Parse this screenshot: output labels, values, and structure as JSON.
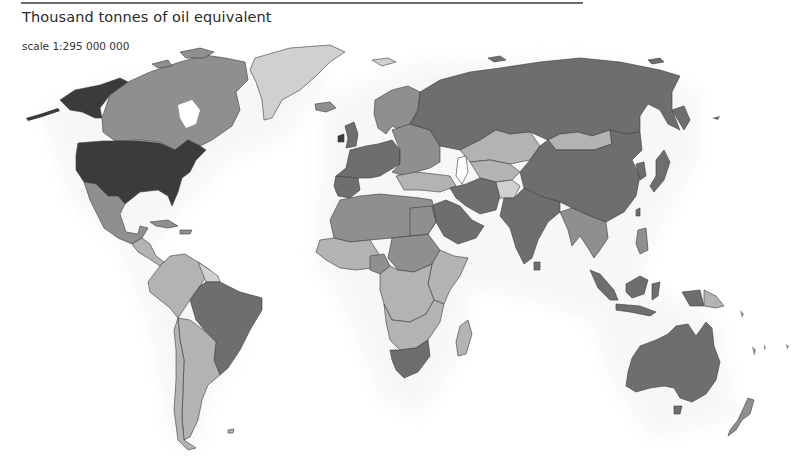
{
  "header": {
    "title": "Thousand tonnes of oil equivalent",
    "scale_label": "scale 1:295 000 000"
  },
  "map": {
    "type": "choropleth",
    "projection": "world",
    "colors": {
      "darkest": "#3b3b3b",
      "dark": "#6e6e6e",
      "medium": "#8f8f8f",
      "light": "#b3b3b3",
      "lightest": "#d0d0d0",
      "halo": "#e6e6e6",
      "border": "#3a3a3a",
      "background": "#ffffff"
    },
    "regions": [
      {
        "name": "United States",
        "class": "darkest"
      },
      {
        "name": "Alaska",
        "class": "darkest"
      },
      {
        "name": "Canada",
        "class": "medium"
      },
      {
        "name": "Greenland",
        "class": "lightest"
      },
      {
        "name": "Mexico",
        "class": "medium"
      },
      {
        "name": "Central America",
        "class": "light"
      },
      {
        "name": "Caribbean",
        "class": "medium"
      },
      {
        "name": "Brazil",
        "class": "dark"
      },
      {
        "name": "Argentina",
        "class": "light"
      },
      {
        "name": "Chile",
        "class": "light"
      },
      {
        "name": "Andean countries",
        "class": "light"
      },
      {
        "name": "Guianas",
        "class": "lightest"
      },
      {
        "name": "Western Europe",
        "class": "dark"
      },
      {
        "name": "Scandinavia",
        "class": "medium"
      },
      {
        "name": "Eastern Europe",
        "class": "medium"
      },
      {
        "name": "Russia",
        "class": "dark"
      },
      {
        "name": "Kazakhstan",
        "class": "light"
      },
      {
        "name": "Central Asia",
        "class": "light"
      },
      {
        "name": "Mongolia",
        "class": "light"
      },
      {
        "name": "China",
        "class": "dark"
      },
      {
        "name": "India",
        "class": "dark"
      },
      {
        "name": "Iran",
        "class": "dark"
      },
      {
        "name": "Saudi Arabia",
        "class": "dark"
      },
      {
        "name": "Afghanistan",
        "class": "lightest"
      },
      {
        "name": "North Africa",
        "class": "medium"
      },
      {
        "name": "West Africa",
        "class": "light"
      },
      {
        "name": "Central Africa",
        "class": "light"
      },
      {
        "name": "East Africa",
        "class": "light"
      },
      {
        "name": "South Africa",
        "class": "dark"
      },
      {
        "name": "Madagascar",
        "class": "light"
      },
      {
        "name": "Japan",
        "class": "dark"
      },
      {
        "name": "Korea",
        "class": "dark"
      },
      {
        "name": "Southeast Asia",
        "class": "medium"
      },
      {
        "name": "Indonesia",
        "class": "dark"
      },
      {
        "name": "Papua New Guinea",
        "class": "light"
      },
      {
        "name": "Australia",
        "class": "dark"
      },
      {
        "name": "New Zealand",
        "class": "medium"
      }
    ],
    "legend": null
  }
}
